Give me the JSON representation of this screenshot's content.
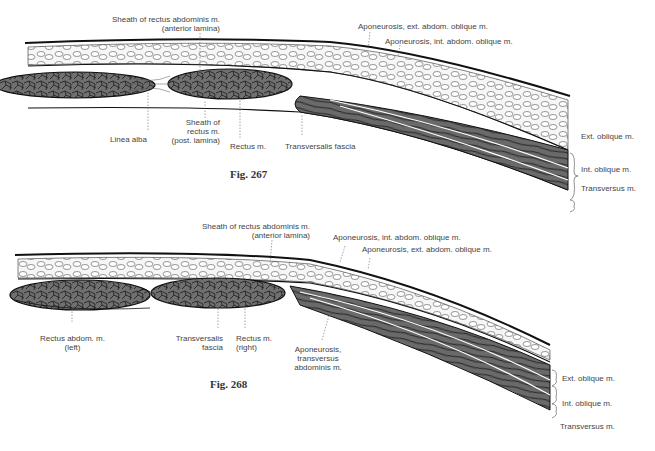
{
  "figures": [
    {
      "id": "fig267",
      "caption": "Fig. 267",
      "labels": {
        "sheath_anterior_1": "Sheath of rectus abdominis m.",
        "sheath_anterior_2": "(anterior lamina)",
        "apo_ext": "Aponeurosis, ext. abdom. oblique m.",
        "apo_int": "Aponeurosis, int. abdom. oblique m.",
        "linea_alba": "Linea alba",
        "sheath_post_1": "Sheath of",
        "sheath_post_2": "rectus m.",
        "sheath_post_3": "(post. lamina)",
        "rectus": "Rectus m.",
        "transversalis": "Transversalis fascia",
        "ext_oblique": "Ext. oblique m.",
        "int_oblique": "Int. oblique m.",
        "transversus": "Transversus m."
      }
    },
    {
      "id": "fig268",
      "caption": "Fig. 268",
      "labels": {
        "sheath_anterior_1": "Sheath of rectus abdominis m.",
        "sheath_anterior_2": "(anterior lamina)",
        "apo_int": "Aponeurosis, int. abdom. oblique m.",
        "apo_ext": "Aponeurosis, ext. abdom. oblique m.",
        "rectus_left_1": "Rectus abdom. m.",
        "rectus_left_2": "(left)",
        "transversalis_1": "Transversalis",
        "transversalis_2": "fascia",
        "rectus_right_1": "Rectus m.",
        "rectus_right_2": "(right)",
        "apo_transv_1": "Aponeurosis,",
        "apo_transv_2": "transversus",
        "apo_transv_3": "abdominis m.",
        "ext_oblique": "Ext. oblique m.",
        "int_oblique": "Int. oblique m.",
        "transversus": "Transversus m."
      }
    }
  ],
  "colors": {
    "muscle_fill": "#6e6e6e",
    "fat_fill": "#f4f4f4",
    "outline": "#111111",
    "label_text": "#444444"
  }
}
